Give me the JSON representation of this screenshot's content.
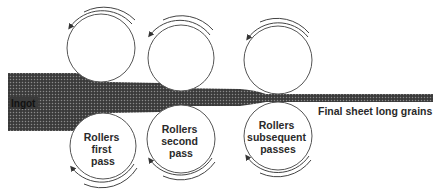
{
  "colors": {
    "sheet_fill": "#3a3a3a",
    "sheet_dots": "#8a8a8a",
    "roller_stroke": "#555555",
    "text": "#2a2a2a",
    "background": "#ffffff"
  },
  "labels": {
    "ingot": "Ingot",
    "final_sheet": "Final sheet long grains"
  },
  "rollers": [
    {
      "id": "first",
      "label_lines": [
        "Rollers",
        "first",
        "pass"
      ],
      "top": {
        "cx": 101,
        "cy": 48,
        "r": 34,
        "rotation": "counterclockwise"
      },
      "bottom": {
        "cx": 103,
        "cy": 146,
        "r": 33,
        "rotation": "clockwise"
      }
    },
    {
      "id": "second",
      "label_lines": [
        "Rollers",
        "second",
        "pass"
      ],
      "top": {
        "cx": 181,
        "cy": 55,
        "r": 33,
        "rotation": "counterclockwise"
      },
      "bottom": {
        "cx": 181,
        "cy": 139,
        "r": 34,
        "rotation": "clockwise"
      }
    },
    {
      "id": "subsequent",
      "label_lines": [
        "Rollers",
        "subsequent",
        "passes"
      ],
      "top": {
        "cx": 278,
        "cy": 60,
        "r": 34,
        "rotation": "counterclockwise"
      },
      "bottom": {
        "cx": 278,
        "cy": 136,
        "r": 34,
        "rotation": "clockwise"
      }
    }
  ]
}
